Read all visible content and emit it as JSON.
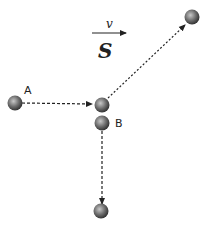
{
  "diagram": {
    "velocity_label": "v",
    "frame_label": "S",
    "ball_a_label": "A",
    "ball_b_label": "B",
    "colors": {
      "ball_dark": "#3a3a3a",
      "ball_light": "#bdbdbd",
      "line": "#222222"
    }
  }
}
